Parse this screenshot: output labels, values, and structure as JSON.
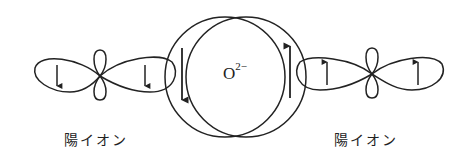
{
  "diagram": {
    "center_ion": {
      "base": "O",
      "charge": "2−"
    },
    "left_cation": {
      "label": "陽イオン"
    },
    "right_cation": {
      "label": "陽イオン"
    },
    "spins": {
      "left_cation": [
        "down",
        "down"
      ],
      "anion_left": "down",
      "anion_right": "up",
      "right_cation": [
        "up",
        "up"
      ]
    },
    "stroke_color": "#222222"
  }
}
